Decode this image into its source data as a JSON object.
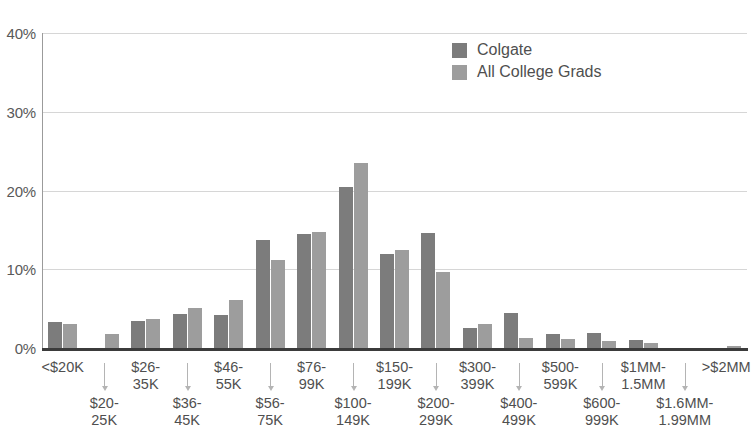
{
  "chart_data": {
    "type": "bar",
    "title": "",
    "subtitle": "",
    "xlabel": "",
    "ylabel": "",
    "ylim": [
      0,
      40
    ],
    "ytick_labels": [
      "0%",
      "10%",
      "20%",
      "30%",
      "40%"
    ],
    "ytick_values": [
      0,
      10,
      20,
      30,
      40
    ],
    "grid": true,
    "legend_position": "top-right",
    "categories": [
      "<$20K",
      "$20-\n25K",
      "$26-\n35K",
      "$36-\n45K",
      "$46-\n55K",
      "$56-\n75K",
      "$76-\n99K",
      "$100-\n149K",
      "$150-\n199K",
      "$200-\n299K",
      "$300-\n399K",
      "$400-\n499K",
      "$500-\n599K",
      "$600-\n999K",
      "$1MM-\n1.5MM",
      "$1.6MM-\n1.99MM",
      ">$2MM"
    ],
    "series": [
      {
        "name": "Colgate",
        "color": "#7c7c7c",
        "values": [
          3.3,
          0.0,
          3.4,
          4.3,
          4.2,
          13.7,
          14.5,
          20.5,
          12.0,
          14.6,
          2.6,
          4.5,
          1.8,
          1.9,
          1.0,
          0.0,
          0.0
        ]
      },
      {
        "name": "All College Grads",
        "color": "#9d9d9d",
        "values": [
          3.0,
          1.8,
          3.7,
          5.1,
          6.1,
          11.2,
          14.7,
          23.5,
          12.5,
          9.7,
          3.0,
          1.3,
          1.1,
          0.9,
          0.6,
          0.0,
          0.2
        ]
      }
    ]
  },
  "legend": {
    "items": [
      {
        "label": "Colgate",
        "swatch_name": "legend-swatch-colgate"
      },
      {
        "label": "All College Grads",
        "swatch_name": "legend-swatch-all-college-grads"
      }
    ]
  }
}
